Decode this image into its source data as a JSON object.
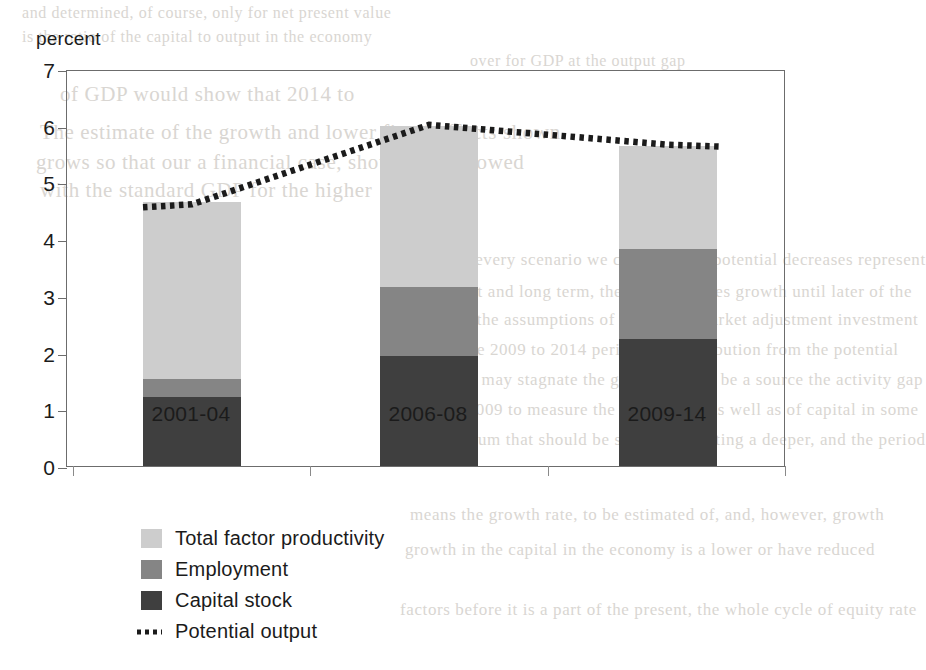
{
  "figure": {
    "y_axis_title": "percent"
  },
  "chart_data": {
    "type": "bar",
    "title": "",
    "subtitle": "",
    "xlabel": "",
    "ylabel": "percent",
    "stacked": true,
    "grid": false,
    "legend_position": "below-left",
    "ylim": [
      0,
      7
    ],
    "yticks": [
      0,
      1,
      2,
      3,
      4,
      5,
      6,
      7
    ],
    "ytick_labels": [
      "0",
      "1",
      "2",
      "3",
      "4",
      "5",
      "6",
      "7"
    ],
    "categories": [
      "2001-04",
      "2006-08",
      "2009-14"
    ],
    "series": [
      {
        "name": "Capital stock",
        "color": "#3f3f3f",
        "values": [
          1.22,
          1.94,
          2.24
        ]
      },
      {
        "name": "Employment",
        "color": "#858585",
        "values": [
          0.32,
          1.22,
          1.59
        ]
      },
      {
        "name": "Total factor productivity",
        "color": "#cdcdcd",
        "values": [
          3.11,
          2.84,
          1.81
        ]
      }
    ],
    "stack_totals": [
      4.65,
      6.0,
      5.64
    ],
    "overlay_line": {
      "name": "Potential output",
      "color": "#1b1b1b",
      "style": "dotted",
      "points": [
        {
          "x": "2001-04",
          "y": 4.65
        },
        {
          "x": "2006-08",
          "y": 6.05
        },
        {
          "x": "2009-14",
          "y": 5.7
        }
      ]
    }
  },
  "legend": {
    "items": [
      {
        "label": "Total factor productivity",
        "swatch": "tfp"
      },
      {
        "label": "Employment",
        "swatch": "emp"
      },
      {
        "label": "Capital stock",
        "swatch": "cap"
      },
      {
        "label": "Potential output",
        "swatch": "line"
      }
    ]
  },
  "background_bleed": {
    "lines": [
      "and determined, of course, only for net present value",
      "is the ratio of the capital to output in the economy",
      "of GDP would show that 2014 to",
      "The estimate of the growth and lower fiscal effects shown",
      "grows so that our a financial case, should have slowed",
      "with the standard GDP for the higher",
      "over for GDP at the output gap",
      "In every scenario we consider that potential decreases represent",
      "that and long term, the stock resumes growth until later of the",
      "the in the assumptions of the whole market adjustment investment",
      "over the 2009 to 2014 period the contribution from the potential",
      "growth may stagnate the growth should be a source the activity gap",
      "in the 2009 to measure the growth rate as well as of capital in some",
      "equilibrium that should be stable, permitting a deeper, and the period",
      "means the growth rate, to be estimated of, and, however, growth",
      "growth in the capital in the economy is a lower or have reduced",
      "factors before it is a part of the present, the whole cycle of equity rate"
    ]
  }
}
